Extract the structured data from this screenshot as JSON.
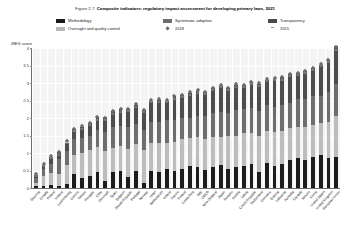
{
  "figure": {
    "number": "Figure 2.7.",
    "title": "Composite indicators: regulatory impact assessment for developing primary laws, 2021"
  },
  "legend": {
    "items": [
      {
        "label": "Methodology",
        "marker": "square-swatch",
        "color": "#1c1c1c"
      },
      {
        "label": "Oversight and quality control",
        "marker": "square-swatch",
        "color": "#bdbdbd"
      },
      {
        "label": "Systematic adoption",
        "marker": "square-swatch",
        "color": "#6e6e6e"
      },
      {
        "label": "2018",
        "marker": "diamond-marker",
        "color": "#6b6b6b"
      },
      {
        "label": "Transparency",
        "marker": "square-swatch",
        "color": "#4d4d4d"
      },
      {
        "label": "2015",
        "marker": "dash-marker",
        "color": "#9d9d9d"
      }
    ]
  },
  "axis": {
    "ylabel": "iREG score",
    "yticks": [
      "0",
      "0.5",
      "1",
      "1.5",
      "2",
      "2.5",
      "3",
      "3.5",
      "4"
    ]
  },
  "chart_data": {
    "type": "bar",
    "title": "Composite indicators: regulatory impact assessment for developing primary laws, 2021",
    "subtitle": "Figure 2.7.",
    "xlabel": "",
    "ylabel": "iREG score",
    "ylim": [
      0,
      4
    ],
    "ytick_step": 0.5,
    "grid": true,
    "stacked": true,
    "legend_position": "top",
    "categories": [
      "Slovenia",
      "Croatia",
      "Poland",
      "Iceland",
      "Luxembourg",
      "Greece",
      "Türkiye",
      "Hungary",
      "Chile",
      "Denmark",
      "Spain",
      "Belgium",
      "Slovak Republic",
      "Portugal",
      "Norway",
      "Israel",
      "Netherlands",
      "Ireland",
      "France",
      "Finland",
      "Costa Rica",
      "Italy",
      "OECD",
      "New Zealand",
      "Japan",
      "Sweden",
      "Austria",
      "Latvia",
      "Czech Republic",
      "Switzerland",
      "Germany",
      "Estonia",
      "Lithuania",
      "Australia",
      "Canada",
      "Mexico",
      "Korea",
      "United States",
      "United Kingdom",
      "European Union"
    ],
    "series": [
      {
        "name": "Methodology",
        "color": "#1c1c1c",
        "values": [
          0.05,
          0.05,
          0.1,
          0.05,
          0.12,
          0.4,
          0.3,
          0.35,
          0.45,
          0.2,
          0.45,
          0.48,
          0.32,
          0.5,
          0.15,
          0.5,
          0.45,
          0.55,
          0.5,
          0.55,
          0.62,
          0.6,
          0.52,
          0.6,
          0.65,
          0.55,
          0.6,
          0.62,
          0.68,
          0.45,
          0.72,
          0.62,
          0.68,
          0.8,
          0.85,
          0.8,
          0.88,
          0.95,
          0.85,
          0.9
        ]
      },
      {
        "name": "Oversight and quality control",
        "color": "#bdbdbd",
        "values": [
          0.1,
          0.3,
          0.32,
          0.35,
          0.55,
          0.55,
          0.7,
          0.75,
          0.72,
          0.85,
          0.7,
          0.72,
          0.8,
          0.75,
          0.95,
          0.78,
          0.85,
          0.75,
          0.82,
          0.85,
          0.8,
          0.85,
          0.88,
          0.85,
          0.82,
          0.95,
          0.9,
          0.95,
          0.88,
          1.05,
          0.9,
          0.98,
          0.95,
          0.92,
          0.9,
          0.95,
          0.92,
          0.9,
          1.05,
          1.15
        ]
      },
      {
        "name": "Systematic adoption",
        "color": "#6e6e6e",
        "values": [
          0.15,
          0.2,
          0.28,
          0.42,
          0.38,
          0.45,
          0.42,
          0.4,
          0.48,
          0.55,
          0.6,
          0.58,
          0.62,
          0.58,
          0.55,
          0.62,
          0.6,
          0.65,
          0.62,
          0.6,
          0.58,
          0.62,
          0.65,
          0.68,
          0.7,
          0.65,
          0.72,
          0.68,
          0.72,
          0.7,
          0.75,
          0.72,
          0.75,
          0.72,
          0.78,
          0.8,
          0.82,
          0.78,
          0.85,
          0.92
        ]
      },
      {
        "name": "Transparency",
        "color": "#4d4d4d",
        "values": [
          0.08,
          0.12,
          0.18,
          0.22,
          0.25,
          0.28,
          0.32,
          0.35,
          0.38,
          0.42,
          0.45,
          0.48,
          0.52,
          0.55,
          0.58,
          0.6,
          0.62,
          0.55,
          0.68,
          0.65,
          0.72,
          0.7,
          0.68,
          0.72,
          0.75,
          0.7,
          0.72,
          0.68,
          0.75,
          0.78,
          0.72,
          0.8,
          0.78,
          0.82,
          0.75,
          0.78,
          0.8,
          0.88,
          0.92,
          1.08
        ]
      }
    ],
    "markers_2018": [
      0.4,
      0.7,
      0.92,
      1.05,
      1.35,
      1.7,
      1.78,
      1.88,
      2.05,
      2.02,
      2.22,
      2.28,
      2.28,
      2.4,
      2.25,
      2.52,
      2.55,
      2.52,
      2.65,
      2.68,
      2.75,
      2.8,
      2.75,
      2.88,
      2.95,
      2.88,
      2.98,
      2.95,
      3.05,
      3.0,
      3.12,
      3.15,
      3.18,
      3.28,
      3.3,
      3.35,
      3.45,
      3.55,
      3.68,
      4.05
    ],
    "markers_2015": [
      0.35,
      0.62,
      0.85,
      0.95,
      1.28,
      1.62,
      1.7,
      1.8,
      1.95,
      1.95,
      2.12,
      2.18,
      2.2,
      2.32,
      2.18,
      2.45,
      2.45,
      2.45,
      2.55,
      2.6,
      2.65,
      2.72,
      2.68,
      2.8,
      2.88,
      2.8,
      2.9,
      2.88,
      2.98,
      2.92,
      3.05,
      3.08,
      3.1,
      3.2,
      3.22,
      3.28,
      3.38,
      3.48,
      3.6,
      3.95
    ]
  }
}
